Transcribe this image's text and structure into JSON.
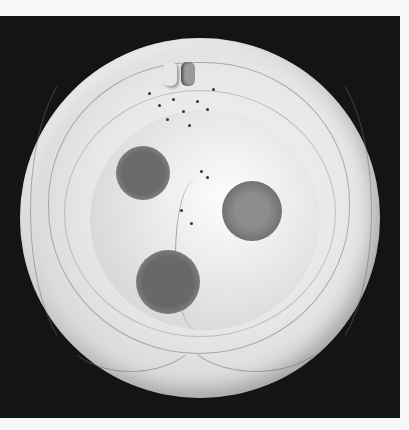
{
  "image": {
    "description": "Grayscale photograph of a round glazed plate on a black background",
    "background_color": "#141414",
    "plate_color": "#e8e8e6",
    "spots": [
      {
        "name": "upper-left-spot",
        "cx": 143,
        "cy": 173,
        "r": 27,
        "color": "#6a6a6a"
      },
      {
        "name": "right-spot",
        "cx": 252,
        "cy": 211,
        "r": 30,
        "color": "#7c7c7a"
      },
      {
        "name": "lower-spot",
        "cx": 168,
        "cy": 282,
        "r": 32,
        "color": "#686868"
      }
    ]
  }
}
